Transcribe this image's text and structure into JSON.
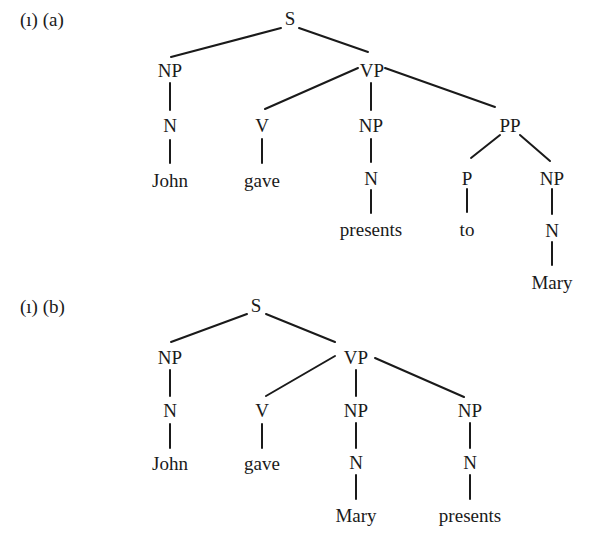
{
  "figure": {
    "trees": [
      {
        "id": "a",
        "label": "(ı) (a)",
        "label_pos": [
          20,
          10
        ],
        "nodes": [
          {
            "id": "S",
            "text": "S",
            "x": 290,
            "y": 18
          },
          {
            "id": "NP1",
            "text": "NP",
            "x": 170,
            "y": 70
          },
          {
            "id": "N1",
            "text": "N",
            "x": 170,
            "y": 125
          },
          {
            "id": "John",
            "text": "John",
            "x": 170,
            "y": 180
          },
          {
            "id": "VP",
            "text": "VP",
            "x": 372,
            "y": 70
          },
          {
            "id": "V",
            "text": "V",
            "x": 262,
            "y": 125
          },
          {
            "id": "gave",
            "text": "gave",
            "x": 262,
            "y": 180
          },
          {
            "id": "NP2",
            "text": "NP",
            "x": 371,
            "y": 125
          },
          {
            "id": "N2",
            "text": "N",
            "x": 371,
            "y": 178
          },
          {
            "id": "presents",
            "text": "presents",
            "x": 371,
            "y": 229
          },
          {
            "id": "PP",
            "text": "PP",
            "x": 510,
            "y": 125
          },
          {
            "id": "P",
            "text": "P",
            "x": 467,
            "y": 178
          },
          {
            "id": "to",
            "text": "to",
            "x": 467,
            "y": 229
          },
          {
            "id": "NP3",
            "text": "NP",
            "x": 552,
            "y": 178
          },
          {
            "id": "N3",
            "text": "N",
            "x": 552,
            "y": 230
          },
          {
            "id": "Mary",
            "text": "Mary",
            "x": 552,
            "y": 282
          }
        ],
        "edges": [
          [
            281,
            28,
            171,
            57
          ],
          [
            299,
            28,
            368,
            52
          ],
          [
            170,
            83,
            170,
            110
          ],
          [
            170,
            140,
            170,
            163
          ],
          [
            358,
            68,
            265,
            109
          ],
          [
            371,
            83,
            371,
            110
          ],
          [
            385,
            68,
            495,
            107
          ],
          [
            262,
            139,
            262,
            163
          ],
          [
            371,
            139,
            371,
            162
          ],
          [
            371,
            190,
            371,
            213
          ],
          [
            500,
            135,
            471,
            158
          ],
          [
            520,
            135,
            550,
            161
          ],
          [
            467,
            189,
            467,
            212
          ],
          [
            552,
            189,
            552,
            214
          ],
          [
            552,
            242,
            552,
            265
          ]
        ]
      },
      {
        "id": "b",
        "label": "(ı) (b)",
        "label_pos": [
          20,
          297
        ],
        "nodes": [
          {
            "id": "S",
            "text": "S",
            "x": 256,
            "y": 305
          },
          {
            "id": "NP1",
            "text": "NP",
            "x": 170,
            "y": 357
          },
          {
            "id": "N1",
            "text": "N",
            "x": 170,
            "y": 410
          },
          {
            "id": "John",
            "text": "John",
            "x": 170,
            "y": 463
          },
          {
            "id": "VP",
            "text": "VP",
            "x": 356,
            "y": 357
          },
          {
            "id": "V",
            "text": "V",
            "x": 262,
            "y": 410
          },
          {
            "id": "gave",
            "text": "gave",
            "x": 262,
            "y": 463
          },
          {
            "id": "NP2",
            "text": "NP",
            "x": 356,
            "y": 410
          },
          {
            "id": "N2",
            "text": "N",
            "x": 356,
            "y": 462
          },
          {
            "id": "Mary",
            "text": "Mary",
            "x": 356,
            "y": 515
          },
          {
            "id": "NP3",
            "text": "NP",
            "x": 470,
            "y": 410
          },
          {
            "id": "N3",
            "text": "N",
            "x": 470,
            "y": 462
          },
          {
            "id": "presents",
            "text": "presents",
            "x": 470,
            "y": 515
          }
        ],
        "edges": [
          [
            247,
            314,
            171,
            342
          ],
          [
            266,
            314,
            335,
            342
          ],
          [
            170,
            370,
            170,
            396
          ],
          [
            170,
            424,
            170,
            448
          ],
          [
            335,
            356,
            266,
            396
          ],
          [
            356,
            370,
            356,
            396
          ],
          [
            375,
            358,
            464,
            397
          ],
          [
            262,
            424,
            262,
            448
          ],
          [
            356,
            423,
            356,
            448
          ],
          [
            356,
            475,
            356,
            499
          ],
          [
            470,
            423,
            470,
            448
          ],
          [
            470,
            475,
            470,
            499
          ]
        ]
      }
    ]
  }
}
